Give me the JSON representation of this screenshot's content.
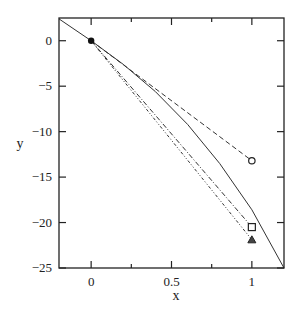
{
  "chart_data": {
    "type": "line",
    "title": "",
    "xlabel": "x",
    "ylabel": "y",
    "xlim": [
      -0.2,
      1.2
    ],
    "ylim": [
      -25,
      2.5
    ],
    "xticks": [
      0,
      0.5,
      1
    ],
    "xtick_labels": [
      "0",
      "0.5",
      "1"
    ],
    "xminor_ticks": [
      0.25,
      0.75
    ],
    "yticks": [
      0,
      -5,
      -10,
      -15,
      -20,
      -25
    ],
    "ytick_labels": [
      "0",
      "−5",
      "−10",
      "−15",
      "−20",
      "−25"
    ],
    "grid": false,
    "legend": null,
    "series": [
      {
        "name": "exact solution",
        "style": "solid",
        "x": [
          -0.2,
          0,
          0.2,
          0.4,
          0.6,
          0.8,
          1.0,
          1.2
        ],
        "y": [
          2.4,
          0,
          -2.6,
          -5.6,
          -9.2,
          -13.5,
          -18.6,
          -25.0
        ]
      },
      {
        "name": "method A",
        "style": "dashed",
        "marker": "circle-open",
        "x": [
          0,
          1
        ],
        "y": [
          0,
          -13.2
        ]
      },
      {
        "name": "method B",
        "style": "dash-dot",
        "marker": "square-open",
        "x": [
          0,
          1
        ],
        "y": [
          0,
          -20.5
        ]
      },
      {
        "name": "method C",
        "style": "dotted-dash",
        "marker": "triangle-filled",
        "x": [
          0,
          1
        ],
        "y": [
          0,
          -21.9
        ]
      }
    ],
    "start_point": {
      "x": 0,
      "y": 0,
      "marker": "filled-circle"
    }
  }
}
